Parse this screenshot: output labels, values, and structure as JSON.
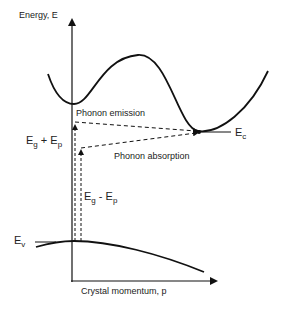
{
  "diagram": {
    "type": "indirect-bandgap-transitions",
    "axes": {
      "y_label": "Energy, E",
      "x_label": "Crystal momentum, p"
    },
    "bands": {
      "conduction": {
        "edge_label": "E",
        "edge_sub": "c"
      },
      "valence": {
        "edge_label": "E",
        "edge_sub": "v"
      }
    },
    "transitions": [
      {
        "name": "Phonon emission",
        "energy_label": "E",
        "energy_sub1": "g",
        "energy_op": " + E",
        "energy_sub2": "p"
      },
      {
        "name": "Phonon absorption",
        "energy_label": "E",
        "energy_sub1": "g",
        "energy_op": " - E",
        "energy_sub2": "p"
      }
    ],
    "colors": {
      "line": "#111111",
      "background": "#ffffff"
    }
  }
}
